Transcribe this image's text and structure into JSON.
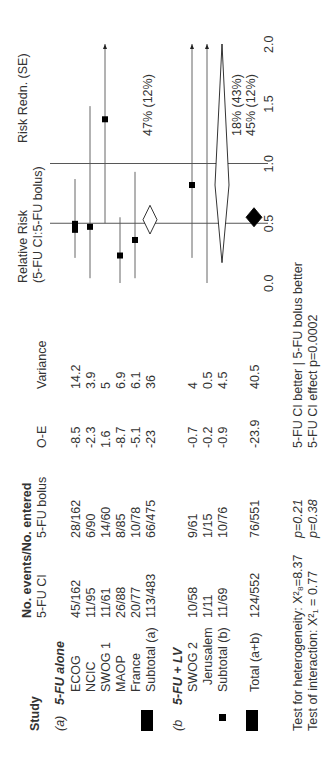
{
  "header": {
    "study": "Study",
    "events_title": "No. events/No. entered",
    "col_ci": "5-FU CI",
    "col_bolus": "5-FU bolus",
    "col_oe": "O-E",
    "col_var": "Variance",
    "rr_title_1": "Relative Risk",
    "rr_title_2": "(5-FU CI:5-FU bolus)",
    "rr_redn": "Risk Redn. (SE)"
  },
  "groups": [
    {
      "tag": "(a)",
      "title": "5-FU alone",
      "rows": [
        {
          "study": "ECOG",
          "ci": "45/162",
          "bolus": "28/162",
          "oe": "-8.5",
          "var": "14.2"
        },
        {
          "study": "NCIC",
          "ci": "11/95",
          "bolus": "6/90",
          "oe": "-2.3",
          "var": "3.9"
        },
        {
          "study": "SWOG 1",
          "ci": "11/61",
          "bolus": "14/60",
          "oe": "1.6",
          "var": "5"
        },
        {
          "study": "MAOP",
          "ci": "26/88",
          "bolus": "8/85",
          "oe": "-8.7",
          "var": "6.9"
        },
        {
          "study": "France",
          "ci": "20/77",
          "bolus": "10/78",
          "oe": "-5.1",
          "var": "6.1"
        }
      ],
      "subtotal": {
        "study": "Subtotal (a)",
        "ci": "113/483",
        "bolus": "66/475",
        "oe": "-23",
        "var": "36",
        "redn": "47% (12%)"
      }
    },
    {
      "tag": "(b",
      "title": "5-FU + LV",
      "rows": [
        {
          "study": "SWOG 2",
          "ci": "10/58",
          "bolus": "9/61",
          "oe": "-0.7",
          "var": "4"
        },
        {
          "study": "Jerusalem",
          "ci": "1/11",
          "bolus": "1/15",
          "oe": "-0.2",
          "var": "0.5"
        }
      ],
      "subtotal": {
        "study": "Subtotal (b)",
        "ci": "11/69",
        "bolus": "10/76",
        "oe": "-0.9",
        "var": "4.5",
        "redn": "18% (43%)"
      }
    }
  ],
  "total": {
    "study": "Total (a+b)",
    "ci": "124/552",
    "bolus": "76/551",
    "oe": "-23.9",
    "var": "40.5",
    "redn": "45% (12%)"
  },
  "footer": {
    "heterogeneity": "Test for heterogeneity: X²₈=8.37",
    "heterogeneity_p": "p=0.21",
    "interaction": "Test of interaction: X²₁ = 0.77",
    "interaction_p": "p=0.38",
    "direction": "5-FU CI better | 5-FU bolus better",
    "effect": "5-FU CI effect p=0.0002"
  },
  "chart_data": {
    "type": "forest",
    "title": "Relative Risk (5-FU CI:5-FU bolus)",
    "xlabel": "Relative Risk",
    "xlim": [
      0.0,
      2.0
    ],
    "ticks": [
      "0.0",
      "0.5",
      "1.0",
      "1.5",
      "2.0"
    ],
    "tick_values": [
      0.0,
      0.5,
      1.0,
      1.5,
      2.0
    ],
    "reference_lines": [
      0.5,
      1.0
    ],
    "studies": [
      {
        "name": "ECOG",
        "rr": 0.47,
        "lo": 0.21,
        "hi": 0.87,
        "marker": "square",
        "size": "large"
      },
      {
        "name": "NCIC",
        "rr": 0.47,
        "lo": 0.04,
        "hi": 1.48,
        "marker": "square",
        "size": "small"
      },
      {
        "name": "SWOG 1",
        "rr": 1.37,
        "lo": 0.5,
        "hi": 2.0,
        "arrow": true,
        "marker": "square",
        "size": "small"
      },
      {
        "name": "MAOP",
        "rr": 0.23,
        "lo": 0.0,
        "hi": 0.55,
        "marker": "square",
        "size": "small"
      },
      {
        "name": "France",
        "rr": 0.36,
        "lo": 0.04,
        "hi": 0.93,
        "marker": "square",
        "size": "small"
      },
      {
        "name": "Subtotal (a)",
        "rr": 0.53,
        "lo": 0.41,
        "hi": 0.65,
        "marker": "diamond-open"
      },
      {
        "name": "SWOG 2",
        "rr": 0.82,
        "lo": 0.21,
        "hi": 2.0,
        "arrow": true,
        "marker": "square",
        "size": "small"
      },
      {
        "name": "Jerusalem",
        "rr": 0.96,
        "lo": 0.0,
        "hi": 2.0,
        "arrow": true,
        "marker": "none"
      },
      {
        "name": "Subtotal (b)",
        "rr": 0.82,
        "lo": 0.17,
        "hi": 2.0,
        "marker": "diamond-open"
      },
      {
        "name": "Total (a+b)",
        "rr": 0.55,
        "lo": 0.47,
        "hi": 0.63,
        "marker": "diamond-filled"
      }
    ],
    "risk_reduction": [
      "47% (12%)",
      "18% (43%)",
      "45% (12%)"
    ]
  }
}
